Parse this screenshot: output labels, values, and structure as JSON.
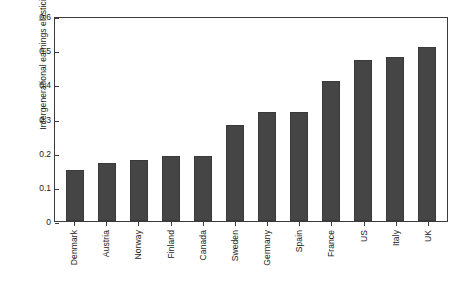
{
  "chart_data": {
    "type": "bar",
    "title": "",
    "xlabel": "",
    "ylabel": "Intergenerational earnings elasticity",
    "categories": [
      "Denmark",
      "Austria",
      "Norway",
      "Finland",
      "Canada",
      "Sweden",
      "Germany",
      "Spain",
      "France",
      "US",
      "Italy",
      "UK"
    ],
    "values": [
      0.15,
      0.17,
      0.18,
      0.19,
      0.19,
      0.28,
      0.32,
      0.32,
      0.41,
      0.47,
      0.48,
      0.51
    ],
    "ylim": [
      0,
      0.6
    ],
    "yticks": [
      0,
      0.1,
      0.2,
      0.3,
      0.4,
      0.5,
      0.6
    ],
    "ytick_labels": [
      "0",
      "0.1",
      "0.2",
      "0.3",
      "0.4",
      "0.5",
      "0.6"
    ],
    "grid": false,
    "legend": false,
    "bar_color": "#454545",
    "frame_color": "#3c3c3c"
  }
}
